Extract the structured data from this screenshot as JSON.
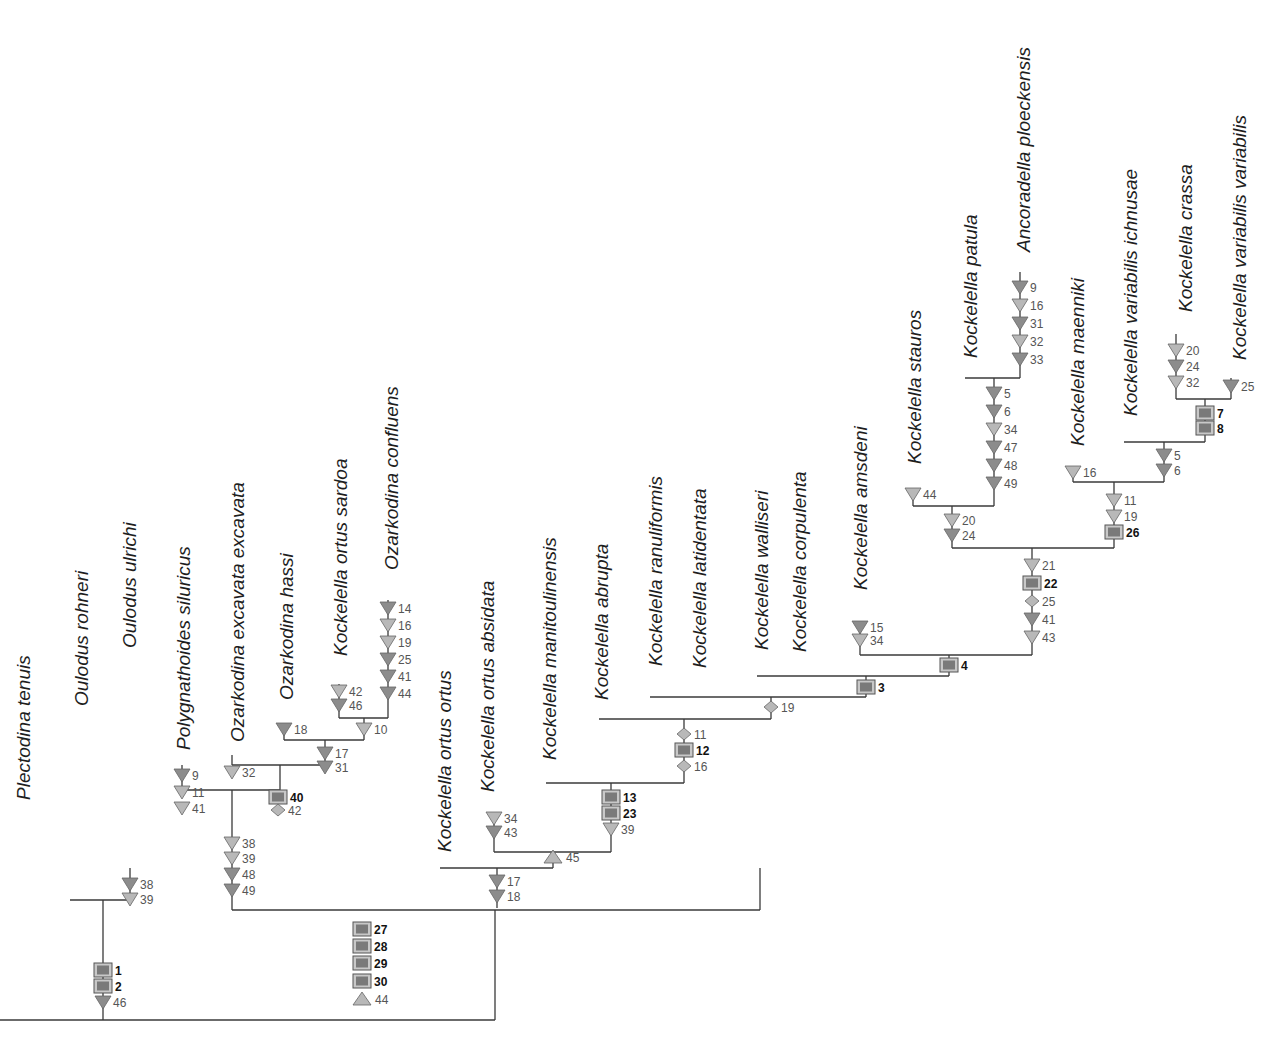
{
  "figure": {
    "type": "cladogram"
  },
  "legend_symbols": {
    "triangle_down_dark": "#8c8c8c",
    "triangle_down_light": "#b8b8b8",
    "triangle_up": "#b8b8b8",
    "diamond": "#b8b8b8",
    "box_fill": "#7a7a7a",
    "box_border": "#555555"
  },
  "taxa": [
    {
      "name": "Plectodina tenuis",
      "x": 30,
      "y": 800
    },
    {
      "name": "Oulodus rohneri",
      "x": 88,
      "y": 706
    },
    {
      "name": "Oulodus ulrichi",
      "x": 136,
      "y": 648
    },
    {
      "name": "Polygnathoides siluricus",
      "x": 190,
      "y": 750
    },
    {
      "name": "Ozarkodina excavata excavata",
      "x": 244,
      "y": 742
    },
    {
      "name": "Ozarkodina hassi",
      "x": 293,
      "y": 700
    },
    {
      "name": "Kockelella ortus sardoa",
      "x": 347,
      "y": 656
    },
    {
      "name": "Ozarkodina confluens",
      "x": 398,
      "y": 570
    },
    {
      "name": "Kockelella ortus ortus",
      "x": 451,
      "y": 852
    },
    {
      "name": "Kockelella ortus absidata",
      "x": 494,
      "y": 792
    },
    {
      "name": "Kockelella manitoulinensis",
      "x": 556,
      "y": 760
    },
    {
      "name": "Kockelella abrupta",
      "x": 608,
      "y": 700
    },
    {
      "name": "Kockelella ranuliformis",
      "x": 662,
      "y": 666
    },
    {
      "name": "Kockelella latidentata",
      "x": 706,
      "y": 668
    },
    {
      "name": "Kockelella walliseri",
      "x": 768,
      "y": 650
    },
    {
      "name": "Kockelella corpulenta",
      "x": 806,
      "y": 652
    },
    {
      "name": "Kockelella amsdeni",
      "x": 867,
      "y": 590
    },
    {
      "name": "Kockelella stauros",
      "x": 921,
      "y": 464
    },
    {
      "name": "Kockelella patula",
      "x": 977,
      "y": 358
    },
    {
      "name": "Ancoradella ploeckensis",
      "x": 1030,
      "y": 252
    },
    {
      "name": "Kockelella maenniki",
      "x": 1084,
      "y": 446
    },
    {
      "name": "Kockelella variabilis ichnusae",
      "x": 1137,
      "y": 416
    },
    {
      "name": "Kockelella crassa",
      "x": 1192,
      "y": 312
    },
    {
      "name": "Kockelella variabilis variabilis",
      "x": 1246,
      "y": 360
    }
  ],
  "branches": [
    {
      "path": "M0,1020 H495"
    },
    {
      "path": "M103,1020 V900"
    },
    {
      "path": "M70,900 H130 V868"
    },
    {
      "path": "M495,1020 V910"
    },
    {
      "path": "M232,910 H760"
    },
    {
      "path": "M232,910 V790"
    },
    {
      "path": "M182,790 H280"
    },
    {
      "path": "M182,790 V765"
    },
    {
      "path": "M280,790 V765"
    },
    {
      "path": "M232,765 H325"
    },
    {
      "path": "M232,765 V755"
    },
    {
      "path": "M325,765 V740"
    },
    {
      "path": "M284,740 H364"
    },
    {
      "path": "M284,740 V726"
    },
    {
      "path": "M364,740 V718"
    },
    {
      "path": "M339,718 H388"
    },
    {
      "path": "M339,718 V684"
    },
    {
      "path": "M388,718 V600"
    },
    {
      "path": "M760,910 V868"
    },
    {
      "path": "M440,868 H553"
    },
    {
      "path": "M497,868 V908"
    },
    {
      "path": "M553,868 V852"
    },
    {
      "path": "M494,852 H611"
    },
    {
      "path": "M494,852 V818"
    },
    {
      "path": "M611,852 V783"
    },
    {
      "path": "M546,783 H684"
    },
    {
      "path": "M684,783 V719"
    },
    {
      "path": "M599,719 H771"
    },
    {
      "path": "M771,719 V697"
    },
    {
      "path": "M650,697 H866"
    },
    {
      "path": "M866,697 V676"
    },
    {
      "path": "M757,676 H949"
    },
    {
      "path": "M949,676 V655"
    },
    {
      "path": "M860,655 H1032"
    },
    {
      "path": "M860,655 V625"
    },
    {
      "path": "M1032,655 V548"
    },
    {
      "path": "M952,548 H1114"
    },
    {
      "path": "M952,548 V506"
    },
    {
      "path": "M913,506 H994"
    },
    {
      "path": "M913,506 V489"
    },
    {
      "path": "M994,506 V378"
    },
    {
      "path": "M965,378 H1020"
    },
    {
      "path": "M1020,378 V272"
    },
    {
      "path": "M1114,548 V482"
    },
    {
      "path": "M1073,482 H1164"
    },
    {
      "path": "M1073,482 V467"
    },
    {
      "path": "M1164,482 V442"
    },
    {
      "path": "M1124,442 H1205"
    },
    {
      "path": "M1205,442 V399"
    },
    {
      "path": "M1176,399 H1231"
    },
    {
      "path": "M1176,399 V334"
    },
    {
      "path": "M1231,399 V378"
    }
  ],
  "characters": [
    {
      "x": 103,
      "y": 970,
      "shape": "box",
      "label": "1"
    },
    {
      "x": 103,
      "y": 986,
      "shape": "box",
      "label": "2"
    },
    {
      "x": 103,
      "y": 1002,
      "shape": "tri-dark",
      "label": "46"
    },
    {
      "x": 130,
      "y": 884,
      "shape": "tri-dark",
      "label": "38"
    },
    {
      "x": 130,
      "y": 899,
      "shape": "tri-light",
      "label": "39"
    },
    {
      "x": 362,
      "y": 929,
      "shape": "box",
      "label": "27"
    },
    {
      "x": 362,
      "y": 946,
      "shape": "box",
      "label": "28"
    },
    {
      "x": 362,
      "y": 963,
      "shape": "box",
      "label": "29"
    },
    {
      "x": 362,
      "y": 981,
      "shape": "box",
      "label": "30"
    },
    {
      "x": 362,
      "y": 999,
      "shape": "tri-up",
      "label": "44"
    },
    {
      "x": 232,
      "y": 843,
      "shape": "tri-light",
      "label": "38"
    },
    {
      "x": 232,
      "y": 858,
      "shape": "tri-light",
      "label": "39"
    },
    {
      "x": 232,
      "y": 874,
      "shape": "tri-dark",
      "label": "48"
    },
    {
      "x": 232,
      "y": 890,
      "shape": "tri-dark",
      "label": "49"
    },
    {
      "x": 182,
      "y": 775,
      "shape": "tri-dark",
      "label": "9"
    },
    {
      "x": 182,
      "y": 792,
      "shape": "tri-light",
      "label": "11"
    },
    {
      "x": 182,
      "y": 808,
      "shape": "tri-light",
      "label": "41"
    },
    {
      "x": 232,
      "y": 772,
      "shape": "tri-light",
      "label": "32"
    },
    {
      "x": 278,
      "y": 797,
      "shape": "box",
      "label": "40"
    },
    {
      "x": 278,
      "y": 810,
      "shape": "diamond",
      "label": "42"
    },
    {
      "x": 325,
      "y": 753,
      "shape": "tri-dark",
      "label": "17"
    },
    {
      "x": 325,
      "y": 767,
      "shape": "tri-dark",
      "label": "31"
    },
    {
      "x": 284,
      "y": 729,
      "shape": "tri-dark",
      "label": "18"
    },
    {
      "x": 364,
      "y": 729,
      "shape": "tri-light",
      "label": "10"
    },
    {
      "x": 339,
      "y": 691,
      "shape": "tri-light",
      "label": "42"
    },
    {
      "x": 339,
      "y": 705,
      "shape": "tri-dark",
      "label": "46"
    },
    {
      "x": 388,
      "y": 608,
      "shape": "tri-dark",
      "label": "14"
    },
    {
      "x": 388,
      "y": 625,
      "shape": "tri-light",
      "label": "16"
    },
    {
      "x": 388,
      "y": 642,
      "shape": "tri-light",
      "label": "19"
    },
    {
      "x": 388,
      "y": 659,
      "shape": "tri-dark",
      "label": "25"
    },
    {
      "x": 388,
      "y": 676,
      "shape": "tri-dark",
      "label": "41"
    },
    {
      "x": 388,
      "y": 693,
      "shape": "tri-dark",
      "label": "44"
    },
    {
      "x": 497,
      "y": 881,
      "shape": "tri-dark",
      "label": "17"
    },
    {
      "x": 497,
      "y": 896,
      "shape": "tri-dark",
      "label": "18"
    },
    {
      "x": 553,
      "y": 857,
      "shape": "tri-up",
      "label": "45"
    },
    {
      "x": 494,
      "y": 818,
      "shape": "tri-light",
      "label": "34"
    },
    {
      "x": 494,
      "y": 832,
      "shape": "tri-dark",
      "label": "43"
    },
    {
      "x": 611,
      "y": 797,
      "shape": "box",
      "label": "13"
    },
    {
      "x": 611,
      "y": 813,
      "shape": "box",
      "label": "23"
    },
    {
      "x": 611,
      "y": 829,
      "shape": "tri-light",
      "label": "39"
    },
    {
      "x": 684,
      "y": 734,
      "shape": "diamond",
      "label": "11"
    },
    {
      "x": 684,
      "y": 750,
      "shape": "box",
      "label": "12"
    },
    {
      "x": 684,
      "y": 766,
      "shape": "diamond",
      "label": "16"
    },
    {
      "x": 771,
      "y": 707,
      "shape": "diamond",
      "label": "19"
    },
    {
      "x": 866,
      "y": 687,
      "shape": "box",
      "label": "3"
    },
    {
      "x": 949,
      "y": 665,
      "shape": "box",
      "label": "4"
    },
    {
      "x": 860,
      "y": 627,
      "shape": "tri-dark",
      "label": "15"
    },
    {
      "x": 860,
      "y": 640,
      "shape": "tri-light",
      "label": "34"
    },
    {
      "x": 1032,
      "y": 565,
      "shape": "tri-light",
      "label": "21"
    },
    {
      "x": 1032,
      "y": 583,
      "shape": "box",
      "label": "22"
    },
    {
      "x": 1032,
      "y": 601,
      "shape": "diamond",
      "label": "25"
    },
    {
      "x": 1032,
      "y": 619,
      "shape": "tri-dark",
      "label": "41"
    },
    {
      "x": 1032,
      "y": 637,
      "shape": "tri-light",
      "label": "43"
    },
    {
      "x": 952,
      "y": 520,
      "shape": "tri-light",
      "label": "20"
    },
    {
      "x": 952,
      "y": 535,
      "shape": "tri-dark",
      "label": "24"
    },
    {
      "x": 913,
      "y": 494,
      "shape": "tri-light",
      "label": "44"
    },
    {
      "x": 994,
      "y": 393,
      "shape": "tri-dark",
      "label": "5"
    },
    {
      "x": 994,
      "y": 411,
      "shape": "tri-dark",
      "label": "6"
    },
    {
      "x": 994,
      "y": 429,
      "shape": "tri-light",
      "label": "34"
    },
    {
      "x": 994,
      "y": 447,
      "shape": "tri-dark",
      "label": "47"
    },
    {
      "x": 994,
      "y": 465,
      "shape": "tri-dark",
      "label": "48"
    },
    {
      "x": 994,
      "y": 483,
      "shape": "tri-dark",
      "label": "49"
    },
    {
      "x": 1020,
      "y": 287,
      "shape": "tri-dark",
      "label": "9"
    },
    {
      "x": 1020,
      "y": 305,
      "shape": "tri-light",
      "label": "16"
    },
    {
      "x": 1020,
      "y": 323,
      "shape": "tri-dark",
      "label": "31"
    },
    {
      "x": 1020,
      "y": 341,
      "shape": "tri-light",
      "label": "32"
    },
    {
      "x": 1020,
      "y": 359,
      "shape": "tri-dark",
      "label": "33"
    },
    {
      "x": 1114,
      "y": 500,
      "shape": "tri-light",
      "label": "11"
    },
    {
      "x": 1114,
      "y": 516,
      "shape": "tri-light",
      "label": "19"
    },
    {
      "x": 1114,
      "y": 532,
      "shape": "box",
      "label": "26"
    },
    {
      "x": 1073,
      "y": 472,
      "shape": "tri-light",
      "label": "16"
    },
    {
      "x": 1164,
      "y": 455,
      "shape": "tri-dark",
      "label": "5"
    },
    {
      "x": 1164,
      "y": 470,
      "shape": "tri-dark",
      "label": "6"
    },
    {
      "x": 1205,
      "y": 413,
      "shape": "box",
      "label": "7"
    },
    {
      "x": 1205,
      "y": 428,
      "shape": "box",
      "label": "8"
    },
    {
      "x": 1176,
      "y": 350,
      "shape": "tri-light",
      "label": "20"
    },
    {
      "x": 1176,
      "y": 366,
      "shape": "tri-dark",
      "label": "24"
    },
    {
      "x": 1176,
      "y": 382,
      "shape": "tri-light",
      "label": "32"
    },
    {
      "x": 1231,
      "y": 386,
      "shape": "tri-dark",
      "label": "25"
    }
  ]
}
